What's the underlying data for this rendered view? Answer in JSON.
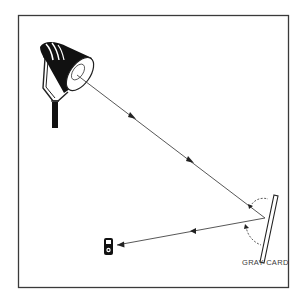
{
  "diagram": {
    "type": "illustration",
    "labels": {
      "gray_card": "GRAY CARD"
    },
    "elements": [
      {
        "id": "lamp",
        "name": "studio light"
      },
      {
        "id": "incident-ray",
        "name": "incident light ray",
        "direction": "lamp to gray card",
        "arrows": 2
      },
      {
        "id": "gray-card",
        "name": "gray card"
      },
      {
        "id": "reflected-ray",
        "name": "reflected light ray",
        "direction": "gray card to light meter",
        "arrows": 2
      },
      {
        "id": "light-meter",
        "name": "handheld light meter"
      },
      {
        "id": "angle-of-incidence",
        "name": "angle arc (incidence)"
      },
      {
        "id": "angle-of-reflection",
        "name": "angle arc (reflection)"
      }
    ],
    "colors": {
      "line": "#444444",
      "frame": "#3a3a3a",
      "fill_dark": "#111111",
      "background": "#ffffff"
    }
  }
}
